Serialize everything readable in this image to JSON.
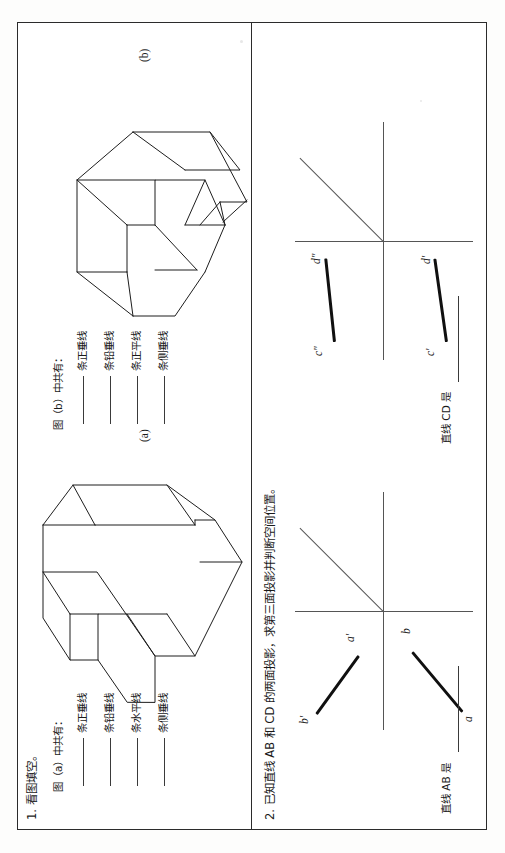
{
  "document": {
    "type": "engineering-drawing-worksheet",
    "ink_color": "#101010",
    "rule_color": "#2b2b2b"
  },
  "problem1": {
    "number_label": "1. 看图填空。",
    "groups": [
      {
        "heading": "图（a）中共有：",
        "figure_label": "(a)",
        "blanks": [
          {
            "unit": "条正垂线"
          },
          {
            "unit": "条铅垂线"
          },
          {
            "unit": "条水平线"
          },
          {
            "unit": "条侧垂线"
          }
        ]
      },
      {
        "heading": "图（b）中共有：",
        "figure_label": "(b)",
        "blanks": [
          {
            "unit": "条正垂线"
          },
          {
            "unit": "条铅垂线"
          },
          {
            "unit": "条正平线"
          },
          {
            "unit": "条侧垂线"
          }
        ]
      }
    ]
  },
  "problem2": {
    "number_label": "2. 已知直线 AB 和 CD 的两面投影，求第三面投影并判断空间位置。",
    "panels": [
      {
        "name": "line-AB",
        "point_labels": [
          "b'",
          "a'",
          "a",
          "b"
        ],
        "answer_prompt": "直线 AB 是"
      },
      {
        "name": "line-CD",
        "point_labels": [
          "d\"",
          "c\"",
          "d'",
          "c'"
        ],
        "answer_prompt": "直线 CD 是"
      }
    ]
  }
}
